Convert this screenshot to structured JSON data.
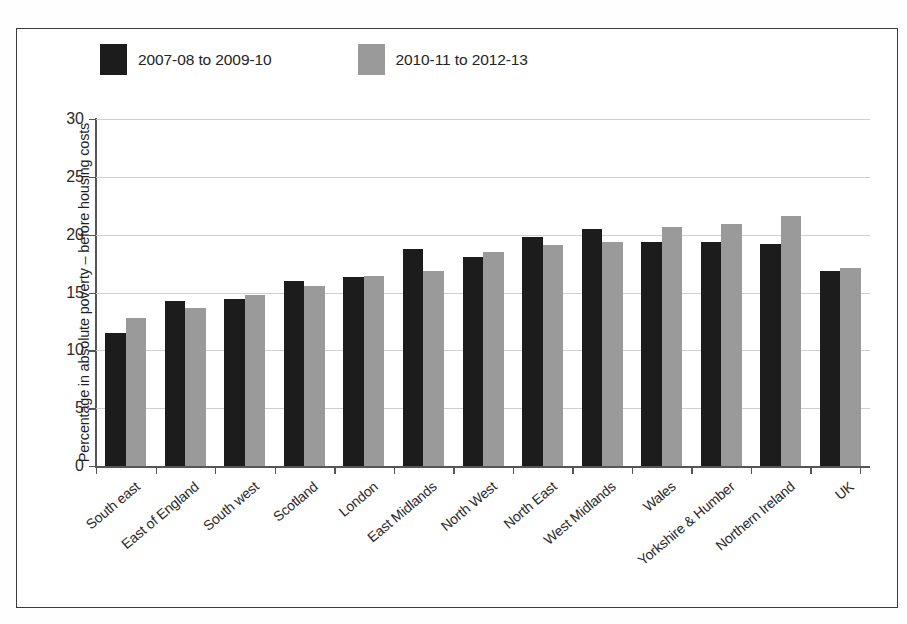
{
  "chart_data": {
    "type": "bar",
    "title": "",
    "xlabel": "",
    "ylabel": "Percentage in absolute poverty – before housing costs",
    "ylim": [
      0,
      30
    ],
    "yticks": [
      0,
      5,
      10,
      15,
      20,
      25,
      30
    ],
    "grid": true,
    "legend_position": "top-left",
    "categories": [
      "South east",
      "East of England",
      "South west",
      "Scotland",
      "London",
      "East Midlands",
      "North West",
      "North East",
      "West Midlands",
      "Wales",
      "Yorkshire & Humber",
      "Northern Ireland",
      "UK"
    ],
    "series": [
      {
        "name": "2007-08 to 2009-10",
        "color": "#1c1c1c",
        "values": [
          11.5,
          14.3,
          14.4,
          16.0,
          16.3,
          18.8,
          18.1,
          19.8,
          20.5,
          19.4,
          19.4,
          19.2,
          16.9
        ]
      },
      {
        "name": "2010-11 to 2012-13",
        "color": "#9a9a9a",
        "values": [
          12.8,
          13.7,
          14.8,
          15.6,
          16.4,
          16.9,
          18.5,
          19.1,
          19.4,
          20.7,
          20.9,
          21.6,
          17.1
        ]
      }
    ]
  },
  "legend": {
    "entries": [
      {
        "label": "2007-08 to 2009-10",
        "swatch_color": "#1c1c1c"
      },
      {
        "label": "2010-11 to 2012-13",
        "swatch_color": "#9a9a9a"
      }
    ]
  },
  "axes": {
    "y_axis_title": "Percentage in absolute poverty – before housing costs",
    "y_tick_labels": [
      "0",
      "5",
      "10",
      "15",
      "20",
      "25",
      "30"
    ]
  },
  "colors": {
    "series_1": "#1c1c1c",
    "series_2": "#9a9a9a",
    "gridline": "#cfcfcf",
    "axis": "#555555",
    "frame": "#3a3a3a",
    "background": "#ffffff"
  }
}
